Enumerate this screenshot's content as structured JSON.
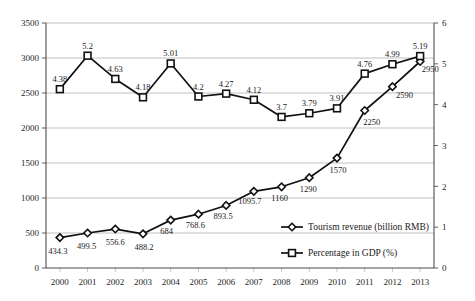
{
  "chart_data": {
    "type": "line",
    "title": "",
    "xlabel": "",
    "categories": [
      "2000",
      "2001",
      "2002",
      "2003",
      "2004",
      "2005",
      "2006",
      "2007",
      "2008",
      "2009",
      "2010",
      "2011",
      "2012",
      "2013"
    ],
    "grid": true,
    "legend_position": "inside-bottom-right",
    "axes": {
      "left": {
        "label": "Tourism revenue (billion RMB)",
        "ylim": [
          0,
          3500
        ],
        "ticks": [
          "0",
          "500",
          "1000",
          "1500",
          "2000",
          "2500",
          "3000",
          "3500"
        ],
        "tick_values": [
          0,
          500,
          1000,
          1500,
          2000,
          2500,
          3000,
          3500
        ]
      },
      "right": {
        "label": "Percentage in GDP (%)",
        "ylim": [
          0,
          6
        ],
        "ticks": [
          "0",
          "1",
          "2",
          "3",
          "4",
          "5",
          "6"
        ],
        "tick_values": [
          0,
          1,
          2,
          3,
          4,
          5,
          6
        ]
      }
    },
    "series": [
      {
        "name": "Tourism revenue (billion RMB)",
        "axis": "left",
        "marker": "diamond",
        "values": [
          434.3,
          499.5,
          556.6,
          488.2,
          684,
          768.6,
          893.5,
          1095.7,
          1160,
          1290,
          1570,
          2250,
          2590,
          2950
        ],
        "labels": [
          "434.3",
          "499.5",
          "556.6",
          "488.2",
          "684",
          "768.6",
          "893.5",
          "1095.7",
          "1160",
          "1290",
          "1570",
          "2250",
          "2590",
          "2950"
        ]
      },
      {
        "name": "Percentage in GDP (%)",
        "axis": "right",
        "marker": "square",
        "values": [
          4.38,
          5.2,
          4.63,
          4.18,
          5.01,
          4.2,
          4.27,
          4.12,
          3.7,
          3.79,
          3.91,
          4.76,
          4.99,
          5.19
        ],
        "labels": [
          "4.38",
          "5.2",
          "4.63",
          "4.18",
          "5.01",
          "4.2",
          "4.27",
          "4.12",
          "3.7",
          "3.79",
          "3.91",
          "4.76",
          "4.99",
          "5.19"
        ]
      }
    ],
    "colors": {
      "line": "#111111",
      "marker_fill": "#ffffff",
      "grid": "#b9b9b9",
      "axis": "#4d4d4d",
      "text": "#1a1a1a"
    }
  },
  "legend": {
    "items": [
      {
        "label": "Tourism revenue (billion RMB)",
        "marker": "diamond"
      },
      {
        "label": "Percentage in GDP (%)",
        "marker": "square"
      }
    ]
  }
}
